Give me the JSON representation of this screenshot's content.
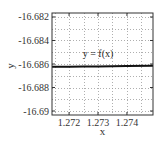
{
  "chart_data": {
    "type": "line",
    "title": "",
    "xlabel": "x",
    "ylabel": "y",
    "xlim": [
      1.27141,
      1.2749
    ],
    "ylim": [
      -16.69034,
      -16.68166
    ],
    "xticks": [
      1.272,
      1.273,
      1.274
    ],
    "xtick_labels": [
      "1.272",
      "1.273",
      "1.274"
    ],
    "yticks": [
      -16.682,
      -16.684,
      -16.686,
      -16.688,
      -16.69
    ],
    "ytick_labels": [
      "-16.682",
      "-16.684",
      "-16.686",
      "-16.688",
      "-16.69"
    ],
    "grid": true,
    "grid_style": "dotted",
    "minor_grid_step": {
      "x": 0.0005,
      "y": 0.001
    },
    "legend": null,
    "annotations": [
      {
        "text": "y = f(x)",
        "x": 1.273,
        "y": -16.6855
      }
    ],
    "series": [
      {
        "name": "y = f(x)",
        "color": "#111111",
        "line_width": 2,
        "x": [
          1.27141,
          1.272,
          1.2725,
          1.273,
          1.2735,
          1.274,
          1.2749
        ],
        "y": [
          -16.68624,
          -16.68623,
          -16.68622,
          -16.68621,
          -16.6862,
          -16.68618,
          -16.68615
        ]
      }
    ]
  },
  "colors": {
    "frame": "#333333",
    "grid": "#9a9a9a",
    "curve": "#111111",
    "text": "#333333"
  }
}
